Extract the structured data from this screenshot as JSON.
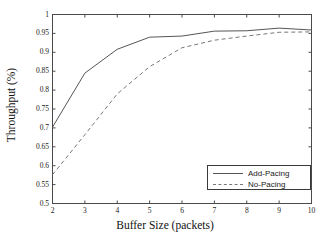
{
  "chart_data": {
    "type": "line",
    "title": "",
    "xlabel": "Buffer Size (packets)",
    "ylabel": "Throughput (%)",
    "xlim": [
      2,
      10
    ],
    "ylim": [
      0.5,
      1
    ],
    "xticks": [
      "2",
      "3",
      "4",
      "5",
      "6",
      "7",
      "8",
      "9",
      "10"
    ],
    "yticks": [
      "0.5",
      "0.55",
      "0.6",
      "0.65",
      "0.7",
      "0.75",
      "0.8",
      "0.85",
      "0.9",
      "0.95",
      "1"
    ],
    "grid": false,
    "legend_position": "lower right",
    "x": [
      2,
      3,
      4,
      5,
      6,
      7,
      8,
      9,
      10
    ],
    "series": [
      {
        "name": "Add-Pacing",
        "style": "solid",
        "color": "#555555",
        "values": [
          0.702,
          0.845,
          0.908,
          0.94,
          0.943,
          0.956,
          0.957,
          0.964,
          0.959
        ]
      },
      {
        "name": "No-Pacing",
        "style": "dashed",
        "color": "#777777",
        "values": [
          0.576,
          0.682,
          0.79,
          0.862,
          0.912,
          0.932,
          0.943,
          0.953,
          0.954
        ]
      }
    ]
  },
  "legend": {
    "entries": [
      {
        "label": "Add-Pacing"
      },
      {
        "label": "No-Pacing"
      }
    ]
  },
  "axes": {
    "x_axis_label": "Buffer Size (packets)",
    "y_axis_label": "Throughput (%)"
  }
}
